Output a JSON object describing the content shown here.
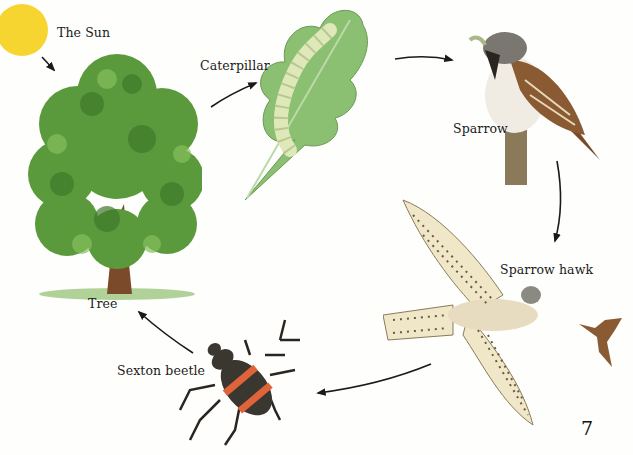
{
  "diagram": {
    "type": "food-chain",
    "nodes": [
      {
        "id": "sun",
        "label": "The Sun"
      },
      {
        "id": "tree",
        "label": "Tree"
      },
      {
        "id": "caterpillar",
        "label": "Caterpillar"
      },
      {
        "id": "sparrow",
        "label": "Sparrow"
      },
      {
        "id": "sparrow_hawk",
        "label": "Sparrow hawk"
      },
      {
        "id": "sexton_beetle",
        "label": "Sexton beetle"
      }
    ],
    "edges": [
      {
        "from": "sun",
        "to": "tree"
      },
      {
        "from": "tree",
        "to": "caterpillar"
      },
      {
        "from": "caterpillar",
        "to": "sparrow"
      },
      {
        "from": "sparrow",
        "to": "sparrow_hawk"
      },
      {
        "from": "sparrow_hawk",
        "to": "sexton_beetle"
      },
      {
        "from": "sexton_beetle",
        "to": "tree"
      }
    ]
  },
  "page_number": "7",
  "colors": {
    "sun": "#f7d531",
    "foliage": "#5a9a3c",
    "foliage_dark": "#3f7a2a",
    "leaf": "#8bbf72",
    "trunk": "#7a4a2a",
    "sparrow_brown": "#8a5a32",
    "hawk_cream": "#efe7c8",
    "beetle_orange": "#e0643a",
    "arrow": "#1a1a1a"
  }
}
